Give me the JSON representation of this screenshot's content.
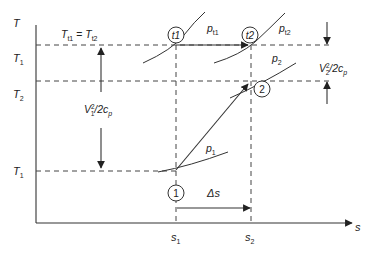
{
  "diagram": {
    "type": "T-s diagram",
    "axes": {
      "y_label": "T",
      "x_label": "s"
    },
    "y_ticks": {
      "Tt": "T",
      "Tt_sub": "t1",
      "T2": "T",
      "T2_sub": "2",
      "T1": "T",
      "T1_sub": "1"
    },
    "x_ticks": {
      "s1": "s",
      "s1_sub": "1",
      "s2": "s",
      "s2_sub": "2"
    },
    "equality_label": {
      "lhs": "T",
      "lhs_sub": "t1",
      "eq": " = ",
      "rhs": "T",
      "rhs_sub": "t2"
    },
    "states": {
      "t1": "t1",
      "t2": "t2",
      "s2": "2",
      "s1": "1"
    },
    "isobars": {
      "pt1": "p",
      "pt1_sub": "t1",
      "pt2": "p",
      "pt2_sub": "t2",
      "p2": "p",
      "p2_sub": "2",
      "p1": "p",
      "p1_sub": "1"
    },
    "dimensions": {
      "v1": "V",
      "v1_sub": "1",
      "v1_sup": "2",
      "v1_tail": "/2c",
      "v1_tail_sub": "p",
      "v2": "V",
      "v2_sub": "2",
      "v2_sup": "2",
      "v2_tail": "/2c",
      "v2_tail_sub": "p",
      "delta_s": "Δs"
    }
  }
}
